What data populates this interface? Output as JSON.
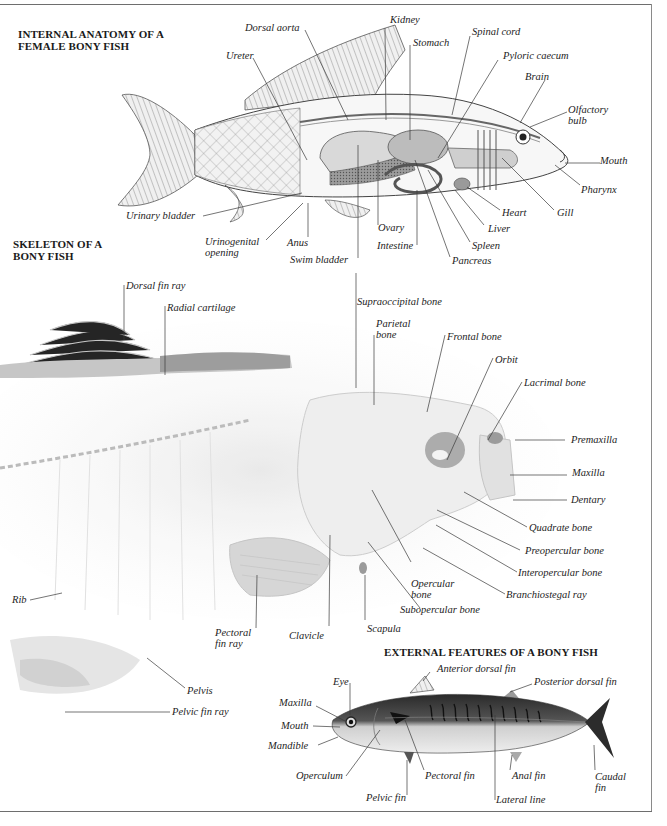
{
  "sections": {
    "internal": {
      "title_line1": "INTERNAL ANATOMY OF A",
      "title_line2": "FEMALE BONY FISH",
      "labels": {
        "dorsal_aorta": "Dorsal aorta",
        "kidney": "Kidney",
        "stomach": "Stomach",
        "spinal_cord": "Spinal cord",
        "pyloric_caecum": "Pyloric caecum",
        "ureter": "Ureter",
        "brain": "Brain",
        "olfactory_bulb_1": "Olfactory",
        "olfactory_bulb_2": "bulb",
        "mouth": "Mouth",
        "pharynx": "Pharynx",
        "gill": "Gill",
        "heart": "Heart",
        "liver": "Liver",
        "spleen": "Spleen",
        "pancreas": "Pancreas",
        "intestine": "Intestine",
        "ovary": "Ovary",
        "swim_bladder": "Swim bladder",
        "anus": "Anus",
        "urinogenital_1": "Urinogenital",
        "urinogenital_2": "opening",
        "urinary_bladder": "Urinary bladder"
      }
    },
    "skeleton": {
      "title_line1": "SKELETON OF A",
      "title_line2": "BONY FISH",
      "labels": {
        "dorsal_fin_ray": "Dorsal fin ray",
        "radial_cartilage": "Radial cartilage",
        "supraoccipital": "Supraoccipital bone",
        "parietal_1": "Parietal",
        "parietal_2": "bone",
        "frontal": "Frontal bone",
        "orbit": "Orbit",
        "lacrimal": "Lacrimal bone",
        "premaxilla": "Premaxilla",
        "maxilla": "Maxilla",
        "dentary": "Dentary",
        "quadrate": "Quadrate bone",
        "preopercular": "Preopercular bone",
        "interopercular": "Interopercular bone",
        "branchiostegal": "Branchiostegal ray",
        "opercular_1": "Opercular",
        "opercular_2": "bone",
        "subopercular": "Subopercular bone",
        "scapula": "Scapula",
        "clavicle": "Clavicle",
        "pectoral_fin_ray_1": "Pectoral",
        "pectoral_fin_ray_2": "fin ray",
        "rib": "Rib",
        "pelvis": "Pelvis",
        "pelvic_fin_ray": "Pelvic fin ray"
      }
    },
    "external": {
      "title": "EXTERNAL FEATURES OF A BONY FISH",
      "labels": {
        "anterior_dorsal_fin": "Anterior dorsal fin",
        "posterior_dorsal_fin": "Posterior dorsal fin",
        "eye": "Eye",
        "maxilla": "Maxilla",
        "mouth": "Mouth",
        "mandible": "Mandible",
        "operculum": "Operculum",
        "pectoral_fin": "Pectoral fin",
        "pelvic_fin": "Pelvic fin",
        "anal_fin": "Anal fin",
        "lateral_line": "Lateral line",
        "caudal_fin_1": "Caudal",
        "caudal_fin_2": "fin"
      }
    }
  },
  "colors": {
    "ink": "#1d1d1d",
    "frame": "#6e6e6e",
    "fish_body_light": "#e4e4e4",
    "fish_body_dark": "#2b2b2b"
  }
}
